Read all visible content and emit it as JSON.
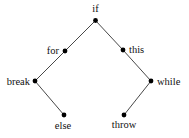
{
  "diagram": {
    "type": "binary-tree",
    "nodes": [
      {
        "id": "if",
        "label": "if",
        "x": 95.5,
        "y": 20.5,
        "lx": 95.5,
        "ly": 12,
        "anchor": "middle"
      },
      {
        "id": "for",
        "label": "for",
        "x": 65,
        "y": 51,
        "lx": 59,
        "ly": 54,
        "anchor": "end"
      },
      {
        "id": "this",
        "label": "this",
        "x": 123,
        "y": 50,
        "lx": 129,
        "ly": 53,
        "anchor": "start"
      },
      {
        "id": "break",
        "label": "break",
        "x": 35,
        "y": 81,
        "lx": 30,
        "ly": 85,
        "anchor": "end"
      },
      {
        "id": "while",
        "label": "while",
        "x": 151,
        "y": 81,
        "lx": 157,
        "ly": 85,
        "anchor": "start"
      },
      {
        "id": "else",
        "label": "else",
        "x": 64,
        "y": 115,
        "lx": 63,
        "ly": 129,
        "anchor": "middle"
      },
      {
        "id": "throw",
        "label": "throw",
        "x": 124,
        "y": 115,
        "lx": 124,
        "ly": 128,
        "anchor": "middle"
      }
    ],
    "edges": [
      [
        "if",
        "for"
      ],
      [
        "if",
        "this"
      ],
      [
        "for",
        "break"
      ],
      [
        "break",
        "else"
      ],
      [
        "this",
        "while"
      ],
      [
        "while",
        "throw"
      ]
    ],
    "colors": {
      "node": "#000000",
      "edge": "#333333",
      "text": "#111111"
    }
  }
}
